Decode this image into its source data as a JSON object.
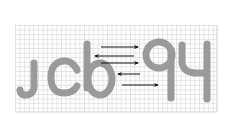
{
  "captcha": {
    "text": "jcbq4",
    "glyphs": [
      "j",
      "c",
      "b",
      "q",
      "4"
    ],
    "glyph_color": "#9a9a9a",
    "grid_color": "#c8c8c8",
    "background_color": "#ffffff",
    "arrow_color": "#111111",
    "grid": {
      "x0": 15,
      "y0": 25,
      "x1": 217,
      "y1": 112,
      "step": 4.6
    },
    "arrows": [
      {
        "direction": "right",
        "y": 47,
        "x_start": 101,
        "x_end": 138
      },
      {
        "direction": "left",
        "y": 56,
        "x_start": 95,
        "x_end": 134
      },
      {
        "direction": "right",
        "y": 63,
        "x_start": 101,
        "x_end": 138
      },
      {
        "direction": "left",
        "y": 74,
        "x_start": 118,
        "x_end": 140
      },
      {
        "direction": "right",
        "y": 85,
        "x_start": 122,
        "x_end": 158
      }
    ]
  }
}
